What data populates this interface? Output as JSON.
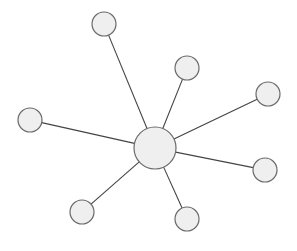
{
  "diagram": {
    "type": "star-graph",
    "colors": {
      "background": "#ffffff",
      "node_fill": "#efefef",
      "node_stroke": "#6a6a6a",
      "edge_stroke": "#444444"
    },
    "hub": {
      "id": "hub",
      "cx": 155,
      "cy": 148,
      "r": 21
    },
    "leaves": [
      {
        "id": "leaf-top",
        "cx": 104,
        "cy": 24,
        "r": 12
      },
      {
        "id": "leaf-upper-right",
        "cx": 187,
        "cy": 68,
        "r": 12
      },
      {
        "id": "leaf-right",
        "cx": 268,
        "cy": 94,
        "r": 12
      },
      {
        "id": "leaf-left",
        "cx": 30,
        "cy": 120,
        "r": 12
      },
      {
        "id": "leaf-lower-right",
        "cx": 265,
        "cy": 170,
        "r": 12
      },
      {
        "id": "leaf-bottom-left",
        "cx": 82,
        "cy": 212,
        "r": 12
      },
      {
        "id": "leaf-bottom-right",
        "cx": 187,
        "cy": 219,
        "r": 12
      }
    ]
  }
}
